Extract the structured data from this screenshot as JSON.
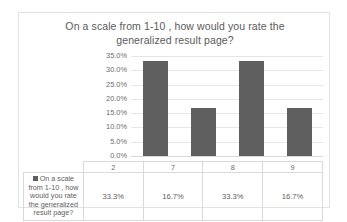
{
  "chart_data": {
    "type": "bar",
    "title": "On a scale from 1-10 , how would you rate the generalized result page?",
    "title_line1": "On a scale from 1-10 , how would you rate the",
    "title_line2": "generalized result page?",
    "categories": [
      "2",
      "7",
      "8",
      "9"
    ],
    "values": [
      33.3,
      16.7,
      33.3,
      16.7
    ],
    "value_labels": [
      "33.3%",
      "16.7%",
      "33.3%",
      "16.7%"
    ],
    "series": [
      {
        "name": "On a scale from 1-10 , how would you rate the generalized result page?",
        "values": [
          33.3,
          16.7,
          33.3,
          16.7
        ]
      }
    ],
    "xlabel": "",
    "ylabel": "",
    "ylim": [
      0,
      35
    ],
    "ytick_labels": [
      "35.0%",
      "30.0%",
      "25.0%",
      "20.0%",
      "15.0%",
      "10.0%",
      "5.0%",
      "0.0%"
    ],
    "ytick_values": [
      35,
      30,
      25,
      20,
      15,
      10,
      5,
      0
    ],
    "grid": true,
    "legend_position": "data-table",
    "data_table_visible": true,
    "colors": {
      "bar": "#5f5f5f",
      "gridline": "#e6e6e6",
      "border": "#e2e2e2",
      "title_text": "#5a5a5a",
      "tick_text": "#6b6b6b",
      "table_border": "#d9d9d9"
    }
  }
}
